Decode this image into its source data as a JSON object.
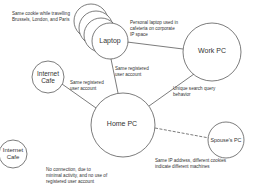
{
  "nodes": {
    "laptop": {
      "label": "Laptop"
    },
    "work_pc": {
      "label": "Work PC"
    },
    "internet_cafe_1": {
      "label": "Internet\nCafe",
      "line1": "Internet",
      "line2": "Cafe"
    },
    "home_pc": {
      "label": "Home PC"
    },
    "spouses_pc": {
      "label": "Spouse's PC"
    },
    "internet_cafe_2": {
      "label": "Internet\nCafe",
      "line1": "Internet",
      "line2": "Cafe"
    }
  },
  "annotations": {
    "laptop_travel": [
      "Same cookie while travelling",
      "Brussels, London, and Paris"
    ],
    "laptop_work": [
      "Personal laptop used in",
      "cafeteria on corporate",
      "IP space"
    ],
    "laptop_home": [
      "Same registered",
      "user account"
    ],
    "cafe1_home": [
      "Same registered",
      "user account"
    ],
    "work_home": [
      "Unique search query",
      "behavior"
    ],
    "spouse_home": [
      "Same IP address, different cookies",
      "indicate different machines"
    ],
    "cafe2_home": [
      "No connection, due to",
      "minimal activity, and no use of",
      "registered user account"
    ]
  },
  "edges": [
    {
      "from": "laptop",
      "to": "work_pc",
      "style": "solid"
    },
    {
      "from": "laptop",
      "to": "home_pc",
      "style": "solid"
    },
    {
      "from": "internet_cafe_1",
      "to": "home_pc",
      "style": "solid"
    },
    {
      "from": "work_pc",
      "to": "home_pc",
      "style": "solid"
    },
    {
      "from": "home_pc",
      "to": "spouses_pc",
      "style": "dashed"
    }
  ]
}
